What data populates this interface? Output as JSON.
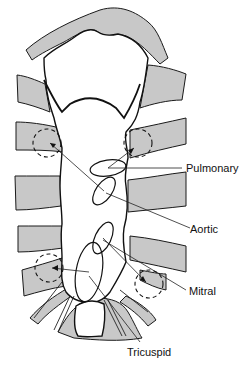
{
  "diagram": {
    "colors": {
      "rib_fill": "#c8c8c8",
      "line": "#111111",
      "background": "#ffffff"
    },
    "labels": {
      "pulmonary": "Pulmonary",
      "aortic": "Aortic",
      "mitral": "Mitral",
      "tricuspid": "Tricuspid"
    },
    "valves": [
      {
        "name": "Pulmonary",
        "cx": 108,
        "cy": 168,
        "rx": 18,
        "ry": 8,
        "rotation": -8
      },
      {
        "name": "Aortic",
        "cx": 104,
        "cy": 191,
        "rx": 8,
        "ry": 16,
        "rotation": 35
      },
      {
        "name": "Mitral",
        "cx": 103,
        "cy": 238,
        "rx": 8,
        "ry": 17,
        "rotation": 25
      },
      {
        "name": "Tricuspid",
        "cx": 89,
        "cy": 272,
        "rx": 13,
        "ry": 30,
        "rotation": 10
      }
    ],
    "auscultation_areas": [
      {
        "position": "right-upper",
        "cx": 47,
        "cy": 143,
        "r": 14
      },
      {
        "position": "left-upper",
        "cx": 138,
        "cy": 143,
        "r": 14
      },
      {
        "position": "right-lower",
        "cx": 49,
        "cy": 268,
        "r": 14
      },
      {
        "position": "left-lower",
        "cx": 149,
        "cy": 284,
        "r": 14
      }
    ]
  }
}
